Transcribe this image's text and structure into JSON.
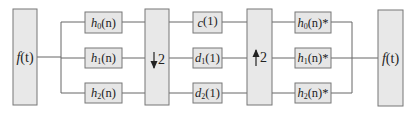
{
  "diagram": {
    "input": {
      "func": "f",
      "arg": "(t)"
    },
    "output": {
      "func": "f",
      "arg": "(t)"
    },
    "analysis_filters": [
      {
        "name": "h",
        "sub": "0",
        "arg": "(n)",
        "suffix": ""
      },
      {
        "name": "h",
        "sub": "1",
        "arg": "(n)",
        "suffix": ""
      },
      {
        "name": "h",
        "sub": "2",
        "arg": "(n)",
        "suffix": ""
      }
    ],
    "downsampler": {
      "arrow": "down",
      "factor": "2"
    },
    "coefficients": [
      {
        "name": "c",
        "sub": "",
        "arg": "(1)"
      },
      {
        "name": "d",
        "sub": "1",
        "arg": "(1)"
      },
      {
        "name": "d",
        "sub": "2",
        "arg": "(1)"
      }
    ],
    "upsampler": {
      "arrow": "up",
      "factor": "2"
    },
    "synthesis_filters": [
      {
        "name": "h",
        "sub": "0",
        "arg": "(n)",
        "suffix": "*"
      },
      {
        "name": "h",
        "sub": "1",
        "arg": "(n)",
        "suffix": "*"
      },
      {
        "name": "h",
        "sub": "2",
        "arg": "(n)",
        "suffix": "*"
      }
    ]
  }
}
